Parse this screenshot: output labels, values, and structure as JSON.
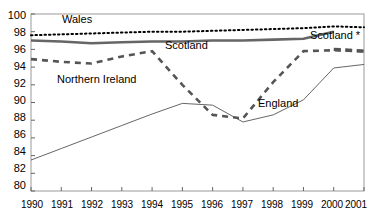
{
  "chart_data": {
    "type": "line",
    "title": "",
    "xlabel": "",
    "ylabel": "",
    "xlim": [
      1990,
      2001
    ],
    "ylim": [
      80,
      100
    ],
    "ytick_step": 2,
    "grid": false,
    "legend_position": "inline-annotations",
    "x": [
      1990,
      1991,
      1992,
      1993,
      1994,
      1995,
      1996,
      1997,
      1998,
      1999,
      2000,
      2001
    ],
    "xtick_labels": [
      "1990",
      "1991",
      "1992",
      "1993",
      "1994",
      "1995",
      "1996",
      "1997",
      "1998",
      "1999",
      "2000",
      "2001"
    ],
    "ytick_labels": [
      "80",
      "82",
      "84",
      "86",
      "88",
      "90",
      "92",
      "94",
      "96",
      "98",
      "100"
    ],
    "series": [
      {
        "name": "Wales",
        "style": "dotted",
        "color": "#000000",
        "values": [
          97.6,
          97.7,
          97.8,
          97.9,
          98.0,
          98.0,
          98.1,
          98.2,
          98.3,
          98.4,
          98.6,
          98.5
        ]
      },
      {
        "name": "Scotland",
        "style": "thick-solid",
        "color": "#666666",
        "values": [
          97.0,
          96.9,
          96.7,
          96.8,
          96.9,
          96.9,
          97.0,
          97.0,
          97.1,
          97.2,
          98.0,
          null
        ]
      },
      {
        "name": "Scotland *",
        "style": "thick-dashed",
        "color": "#555555",
        "values": [
          null,
          null,
          null,
          null,
          null,
          null,
          null,
          null,
          null,
          null,
          96.0,
          95.8
        ]
      },
      {
        "name": "Northern Ireland",
        "style": "heavy-dashed",
        "color": "#555555",
        "values": [
          94.9,
          94.6,
          94.4,
          95.2,
          95.8,
          92.0,
          88.6,
          88.2,
          92.3,
          95.8,
          95.9,
          95.8
        ]
      },
      {
        "name": "England",
        "style": "thin-solid",
        "color": "#555555",
        "values": [
          83.5,
          84.8,
          86.1,
          87.4,
          88.7,
          89.9,
          89.7,
          87.8,
          88.6,
          90.3,
          93.9,
          94.3
        ]
      }
    ],
    "annotations": [
      {
        "text": "Wales",
        "series": "Wales"
      },
      {
        "text": "Scotland",
        "series": "Scotland"
      },
      {
        "text": "Scotland *",
        "series": "Scotland *"
      },
      {
        "text": "Northern Ireland",
        "series": "Northern Ireland"
      },
      {
        "text": "England",
        "series": "England"
      }
    ]
  }
}
